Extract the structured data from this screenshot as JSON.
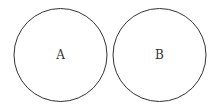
{
  "diagram": {
    "type": "two disjoint sets",
    "sets": [
      {
        "label": "A",
        "cx": 60.5,
        "cy": 55,
        "r": 46.5
      },
      {
        "label": "B",
        "cx": 159.5,
        "cy": 55,
        "r": 46.5
      }
    ],
    "stroke_color": "#333333",
    "background": "#ffffff"
  }
}
